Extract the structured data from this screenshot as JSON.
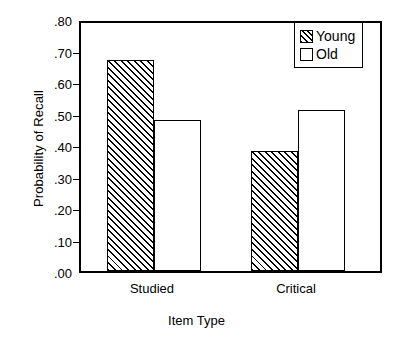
{
  "chart_data": {
    "type": "bar",
    "title": "",
    "xlabel": "Item Type",
    "ylabel": "Probability of Recall",
    "categories": [
      "Studied",
      "Critical"
    ],
    "series": [
      {
        "name": "Young",
        "values": [
          0.67,
          0.38
        ],
        "fill": "diagonal-hatch",
        "color": "#000000"
      },
      {
        "name": "Old",
        "values": [
          0.48,
          0.51
        ],
        "fill": "white",
        "color": "#ffffff"
      }
    ],
    "ylim": [
      0.0,
      0.8
    ],
    "ytick_values": [
      0.0,
      0.1,
      0.2,
      0.3,
      0.4,
      0.5,
      0.6,
      0.7,
      0.8
    ],
    "ytick_labels": [
      ".00",
      ".10",
      ".20",
      ".30",
      ".40",
      ".50",
      ".60",
      ".70",
      ".80"
    ],
    "grid": false,
    "legend_position": "top-right",
    "legend_entries": [
      "Young",
      "Old"
    ],
    "axis_color": "#000000",
    "background_color": "#ffffff"
  },
  "legend": {
    "young_label": "Young",
    "old_label": "Old"
  },
  "axes": {
    "y_title": "Probability of Recall",
    "x_title": "Item Type"
  }
}
